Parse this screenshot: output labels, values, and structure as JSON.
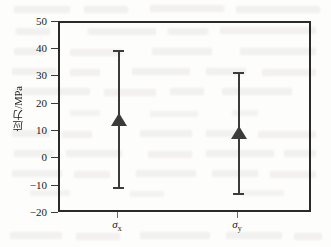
{
  "chart_data": {
    "type": "scatter",
    "title": "",
    "subtitle": "",
    "xlabel": "",
    "ylabel": "应力/MPa",
    "categories": [
      "σx",
      "σy"
    ],
    "category_labels_html": [
      "σ<sub>x</sub>",
      "σ<sub>y</sub>"
    ],
    "values": [
      15,
      10
    ],
    "error_low": [
      -8,
      -9.5
    ],
    "error_high": [
      38,
      32
    ],
    "series": [
      {
        "name": "应力",
        "points": [
          {
            "category": "σx",
            "value": 15,
            "low": -8,
            "high": 38
          },
          {
            "category": "σy",
            "value": 10,
            "low": -9.5,
            "high": 32
          }
        ]
      }
    ],
    "ylim": [
      -20,
      50
    ],
    "ytick_values": [
      50,
      40,
      30,
      20,
      10,
      0,
      -10,
      -20
    ],
    "ytick_labels": [
      "50",
      "40",
      "30",
      "20",
      "10",
      "0",
      "−10",
      "−20"
    ],
    "xlim": [
      0,
      1
    ],
    "xtick_positions": [
      0.25,
      0.75
    ],
    "grid": false,
    "legend": null,
    "marker": "triangle-up",
    "colors": {
      "marker": "#3b3b3b",
      "errorbar": "#3b3b3b",
      "frame": "#2a2a2a",
      "background": "#fdfdfc",
      "text": "#1a1a1a"
    }
  },
  "figure": {
    "y_axis_title": "应力/MPa",
    "background_note": "scanned-page-bleed-through"
  }
}
